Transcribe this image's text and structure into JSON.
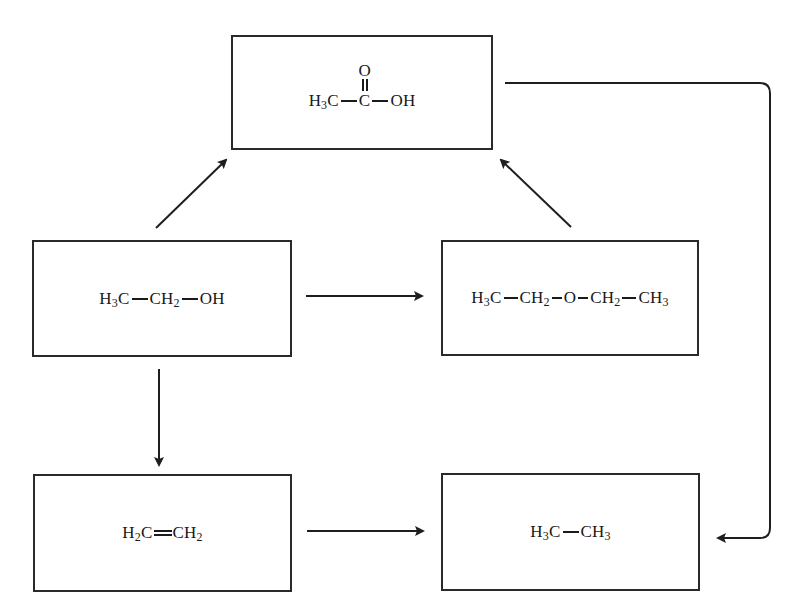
{
  "diagram": {
    "type": "chemical-reaction-scheme",
    "nodes": [
      {
        "id": "acetic_acid",
        "name": "Acetic acid",
        "parts": {
          "a": "H",
          "a_sub": "3",
          "b": "C",
          "c": "C",
          "c_top": "O",
          "d": "OH"
        }
      },
      {
        "id": "ethanol",
        "name": "Ethanol",
        "parts": {
          "a": "H",
          "a_sub": "3",
          "b": "C",
          "c": "CH",
          "c_sub": "2",
          "d": "OH"
        }
      },
      {
        "id": "diethyl_ether",
        "name": "Diethyl ether",
        "parts": {
          "a": "H",
          "a_sub": "3",
          "b": "C",
          "c": "CH",
          "c_sub": "2",
          "d": "O",
          "e": "CH",
          "e_sub": "2",
          "f": "CH",
          "f_sub": "3"
        }
      },
      {
        "id": "ethylene",
        "name": "Ethylene",
        "parts": {
          "a": "H",
          "a_sub": "2",
          "b": "C",
          "c": "CH",
          "c_sub": "2"
        }
      },
      {
        "id": "ethane",
        "name": "Ethane",
        "parts": {
          "a": "H",
          "a_sub": "3",
          "b": "C",
          "c": "CH",
          "c_sub": "3"
        }
      }
    ],
    "edges": [
      {
        "from": "ethanol",
        "to": "acetic_acid"
      },
      {
        "from": "diethyl_ether",
        "to": "acetic_acid"
      },
      {
        "from": "ethanol",
        "to": "diethyl_ether"
      },
      {
        "from": "ethanol",
        "to": "ethylene"
      },
      {
        "from": "ethylene",
        "to": "ethane"
      },
      {
        "from": "acetic_acid",
        "to": "ethane"
      }
    ],
    "colors": {
      "stroke": "#2a2a2a",
      "background": "#ffffff",
      "text": "#1a1a1a"
    }
  }
}
